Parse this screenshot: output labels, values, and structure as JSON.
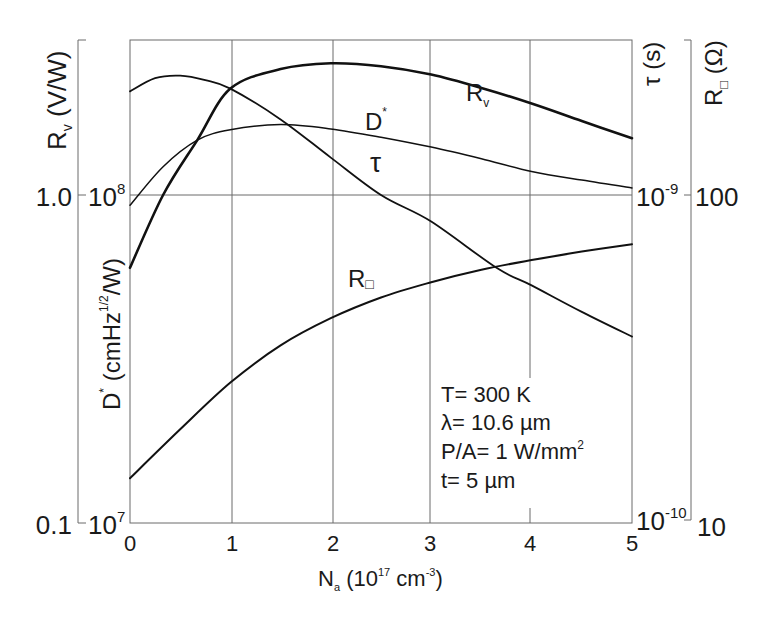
{
  "chart_data": {
    "type": "line",
    "title": "",
    "xlabel": "N_a (10^17 cm^-3)",
    "xlabel_parts": {
      "main": "N",
      "sub": "a",
      "rest1": " (10",
      "sup1": "17",
      "rest2": " cm",
      "sup2": "-3",
      "rest3": ")"
    },
    "x_ticks": [
      "0",
      "1",
      "2",
      "3",
      "4",
      "5"
    ],
    "xlim": [
      0,
      5
    ],
    "grid": true,
    "y_axes": [
      {
        "id": "Rv",
        "side": "left-outer",
        "label": "R_v (V/W)",
        "scale": "log",
        "ylim": [
          0.1,
          2.95
        ],
        "ticks": [
          {
            "value": 0.1,
            "label": "0.1"
          },
          {
            "value": 1.0,
            "label": "1.0"
          }
        ]
      },
      {
        "id": "Dstar",
        "side": "left-inner",
        "label": "D* (cmHz^1/2/W)",
        "scale": "log",
        "ylim": [
          10000000.0,
          295000000.0
        ],
        "ticks": [
          {
            "value": 10000000.0,
            "label": "10",
            "exp": "7"
          },
          {
            "value": 100000000.0,
            "label": "10",
            "exp": "8"
          }
        ]
      },
      {
        "id": "tau",
        "side": "right-inner",
        "label": "τ (s)",
        "scale": "log",
        "ylim": [
          1e-10,
          2.95e-09
        ],
        "ticks": [
          {
            "value": 1e-10,
            "label": "10",
            "exp": "-10"
          },
          {
            "value": 1e-09,
            "label": "10",
            "exp": "-9"
          }
        ]
      },
      {
        "id": "Rsq",
        "side": "right-outer",
        "label": "R□ (Ω)",
        "scale": "log",
        "ylim": [
          10,
          295
        ],
        "ticks": [
          {
            "value": 10,
            "label": "10"
          },
          {
            "value": 100,
            "label": "100"
          }
        ]
      }
    ],
    "series": [
      {
        "name": "R_v",
        "axis": "Rv",
        "weight": "thick",
        "x": [
          0,
          0.33,
          0.67,
          1,
          1.5,
          2,
          2.5,
          3,
          3.5,
          4,
          4.5,
          5
        ],
        "values": [
          0.6,
          1.0,
          1.47,
          2.11,
          2.42,
          2.52,
          2.47,
          2.33,
          2.12,
          1.9,
          1.68,
          1.49
        ]
      },
      {
        "name": "D*",
        "axis": "Dstar",
        "weight": "thin",
        "x": [
          0,
          0.33,
          0.67,
          1,
          1.5,
          2,
          2.5,
          3,
          3.5,
          4,
          4.5,
          5
        ],
        "values": [
          93000000.0,
          122000000.0,
          147000000.0,
          158000000.0,
          164000000.0,
          159000000.0,
          150000000.0,
          140000000.0,
          129000000.0,
          118000000.0,
          111000000.0,
          105000000.0
        ]
      },
      {
        "name": "τ",
        "axis": "tau",
        "weight": "medium",
        "x": [
          0,
          0.25,
          0.5,
          0.75,
          1,
          1.5,
          2,
          2.5,
          3,
          3.65,
          4,
          4.5,
          5
        ],
        "values": [
          2.07e-09,
          2.27e-09,
          2.31e-09,
          2.24e-09,
          2.11e-09,
          1.7e-09,
          1.3e-09,
          1e-09,
          8.3e-10,
          6e-10,
          5.3e-10,
          4.4e-10,
          3.7e-10
        ]
      },
      {
        "name": "R□",
        "axis": "Rsq",
        "weight": "medium",
        "x": [
          0,
          0.5,
          1,
          1.5,
          2,
          2.5,
          3,
          3.5,
          4,
          4.5,
          5
        ],
        "values": [
          13.7,
          19.3,
          26.8,
          34.8,
          42.1,
          48.7,
          54.2,
          59.2,
          63.3,
          67.2,
          70.8
        ]
      }
    ],
    "curve_labels": [
      {
        "series": "R_v",
        "main": "R",
        "sub": "v",
        "at_x": 3.4,
        "note": "above curve"
      },
      {
        "series": "D*",
        "main": "D",
        "sup": "*",
        "at_x": 2.35,
        "note": "above curve"
      },
      {
        "series": "τ",
        "main": "τ",
        "at_x": 2.45,
        "note": "right of curve"
      },
      {
        "series": "R□",
        "main": "R",
        "sub": "□",
        "at_x": 2.15,
        "note": "above curve"
      }
    ],
    "annotations": {
      "line1": "T= 300 K",
      "line2": "λ= 10.6 µm",
      "line3_main": "P/A= 1 W/mm",
      "line3_sup": "2",
      "line4": "t= 5 µm"
    },
    "axis_labels": {
      "rv": {
        "main": "R",
        "sub": "v",
        "rest": " (V/W)"
      },
      "dstar": {
        "main": "D",
        "sup1": "*",
        "rest1": " (cmHz",
        "sup2": "1/2",
        "rest2": "/W)"
      },
      "tau": "τ (s)",
      "rsq": {
        "main": "R",
        "sub": "□",
        "rest": " (Ω)"
      }
    },
    "colors": {
      "line": "#111111",
      "grid": "#6a6a6a",
      "background": "#ffffff"
    }
  }
}
